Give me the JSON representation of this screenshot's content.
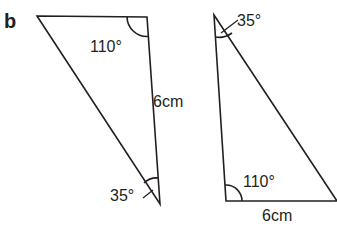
{
  "part_label": "b",
  "triangle_left": {
    "vertices": {
      "top_left": [
        37,
        16
      ],
      "top_right": [
        147,
        17
      ],
      "bottom": [
        160,
        204
      ]
    },
    "angle_top_right": "110°",
    "angle_bottom": "35°",
    "side_right": "6cm"
  },
  "triangle_right": {
    "vertices": {
      "top": [
        214,
        15
      ],
      "bottom_left": [
        226,
        201
      ],
      "bottom_right": [
        337,
        201
      ]
    },
    "angle_top": "35°",
    "angle_bottom_left": "110°",
    "side_bottom": "6cm"
  },
  "colors": {
    "stroke": "#231f20",
    "background": "#ffffff"
  }
}
